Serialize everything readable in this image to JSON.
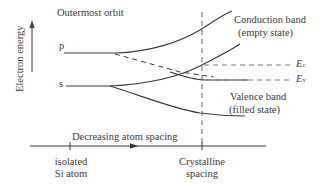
{
  "diagram": {
    "title_label": "Outermost orbit",
    "y_axis_label": "Electron energy",
    "x_axis_label": "Decreasing atom spacing",
    "levels": {
      "p": "p",
      "s": "s"
    },
    "x_ticks": [
      {
        "line1": "isolated",
        "line2": "Si atom"
      },
      {
        "line1": "Crystalline",
        "line2": "spacing"
      }
    ],
    "bands": {
      "conduction": {
        "line1": "Conduction band",
        "line2": "(empty state)"
      },
      "valence": {
        "line1": "Valence band",
        "line2": "(filled state)"
      }
    },
    "energy_levels": {
      "ec": {
        "symbol": "E",
        "sub": "c"
      },
      "ev": {
        "symbol": "E",
        "sub": "v"
      }
    },
    "colors": {
      "line": "#3a3a3a",
      "dash": "#6a6a6a"
    }
  }
}
